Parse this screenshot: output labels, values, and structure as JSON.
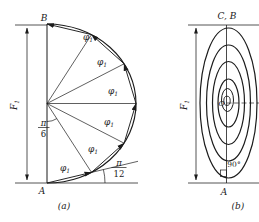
{
  "figure_a": {
    "caption": "(a)",
    "point_top": "B",
    "point_bottom": "A",
    "force_label": "F",
    "force_sub": "1",
    "phi_label": "φ",
    "phi_sub": "1",
    "angle_center": {
      "num": "π",
      "den": "6"
    },
    "angle_base": {
      "num": "π",
      "den": "12"
    }
  },
  "figure_b": {
    "caption": "(b)",
    "point_top": "C, B",
    "point_bottom": "A",
    "center_label": "O",
    "right_angle_label": "90°",
    "force_label": "F",
    "force_sub": "1"
  },
  "colors": {
    "line": "#1b1b1b",
    "background": "#ffffff"
  }
}
